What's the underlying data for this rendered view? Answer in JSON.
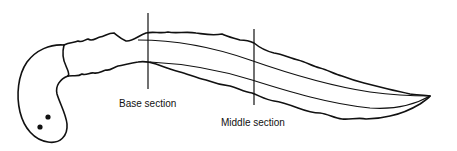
{
  "diagram": {
    "labels": {
      "base_section": "Base section",
      "middle_section": "Middle section"
    },
    "colors": {
      "line": "#111111",
      "background": "#ffffff"
    }
  }
}
